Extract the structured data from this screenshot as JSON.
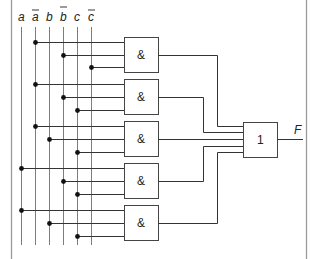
{
  "diagram": {
    "type": "logic-circuit",
    "inputs": [
      {
        "name": "a",
        "label": "a",
        "negated": false,
        "x": 21
      },
      {
        "name": "a-bar",
        "label": "a",
        "negated": true,
        "x": 35
      },
      {
        "name": "b",
        "label": "b",
        "negated": false,
        "x": 49
      },
      {
        "name": "b-bar",
        "label": "b",
        "negated": true,
        "x": 63
      },
      {
        "name": "c",
        "label": "c",
        "negated": false,
        "x": 77
      },
      {
        "name": "c-bar",
        "label": "c",
        "negated": true,
        "x": 91
      }
    ],
    "and_gates": [
      {
        "label": "&",
        "y": 37,
        "inputs": [
          "a-bar",
          "b-bar",
          "c-bar"
        ],
        "input_y": [
          42,
          55,
          67
        ],
        "input_x": [
          35,
          63,
          91
        ],
        "out_y": 55,
        "route_x": 217,
        "or_in_y": 126
      },
      {
        "label": "&",
        "y": 79,
        "inputs": [
          "a-bar",
          "b-bar",
          "c"
        ],
        "input_y": [
          84,
          97,
          110
        ],
        "input_x": [
          35,
          63,
          77
        ],
        "out_y": 97,
        "route_x": 203,
        "or_in_y": 132
      },
      {
        "label": "&",
        "y": 121,
        "inputs": [
          "a-bar",
          "b",
          "c"
        ],
        "input_y": [
          126,
          139,
          152
        ],
        "input_x": [
          35,
          49,
          77
        ],
        "out_y": 140,
        "route_x": null,
        "or_in_y": 140
      },
      {
        "label": "&",
        "y": 163,
        "inputs": [
          "a",
          "b-bar",
          "c"
        ],
        "input_y": [
          168,
          181,
          194
        ],
        "input_x": [
          21,
          63,
          77
        ],
        "out_y": 181,
        "route_x": 203,
        "or_in_y": 146
      },
      {
        "label": "&",
        "y": 205,
        "inputs": [
          "a",
          "b",
          "c"
        ],
        "input_y": [
          210,
          223,
          236
        ],
        "input_x": [
          21,
          49,
          77
        ],
        "out_y": 223,
        "route_x": 217,
        "or_in_y": 152
      }
    ],
    "or_gate": {
      "label": "1"
    },
    "output": {
      "label": "F"
    }
  }
}
